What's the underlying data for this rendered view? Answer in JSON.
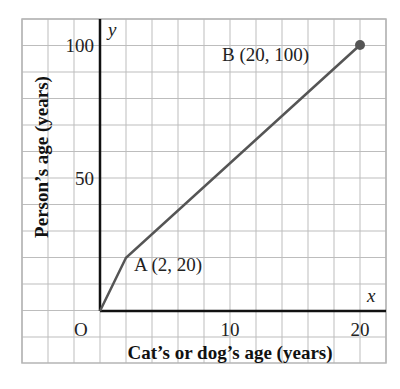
{
  "chart_data": {
    "type": "line",
    "title": "",
    "xlabel": "Cat’s or dog’s age (years)",
    "ylabel": "Person’s age (years)",
    "x_axis_var": "x",
    "y_axis_var": "y",
    "origin_label": "O",
    "x_ticks": [
      "10",
      "20"
    ],
    "y_ticks": [
      "50",
      "100"
    ],
    "xlim": [
      -6,
      22
    ],
    "ylim": [
      -20,
      110
    ],
    "grid": true,
    "series": [
      {
        "name": "age conversion",
        "x": [
          0,
          2,
          20
        ],
        "y": [
          0,
          20,
          100
        ]
      }
    ],
    "annotations": [
      {
        "label": "A (2, 20)",
        "x": 2,
        "y": 20
      },
      {
        "label": "B (20, 100)",
        "x": 20,
        "y": 100
      }
    ],
    "colors": {
      "line": "#555555",
      "grid": "#bdbdbd",
      "axes": "#111111"
    }
  }
}
